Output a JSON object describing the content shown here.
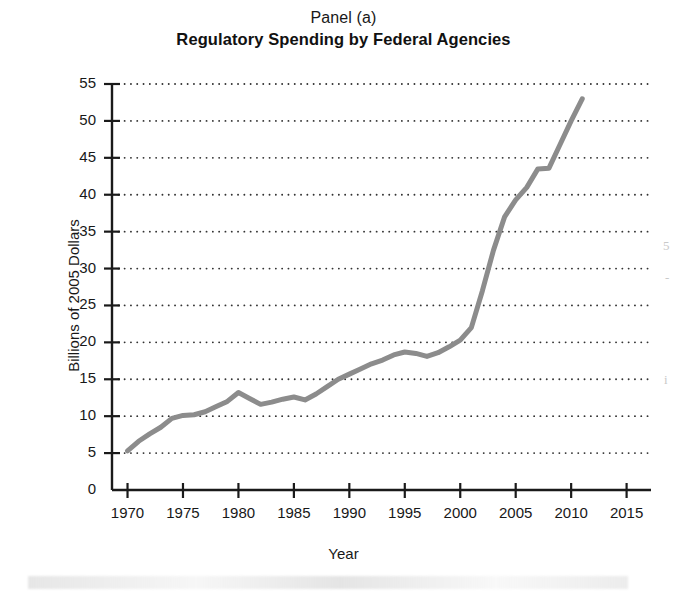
{
  "figure": {
    "panel_label": "Panel (a)",
    "title": "Regulatory Spending by Federal Agencies",
    "xlabel": "Year",
    "ylabel": "Billions of 2005 Dollars",
    "line_color": "#8c8c8c",
    "axis_color": "#1a1a1a",
    "grid_color": "#333333"
  },
  "edge_artifacts": {
    "right_top": "5",
    "right_mid": "-",
    "right_low": "i"
  },
  "chart_data": {
    "type": "line",
    "title": "Regulatory Spending by Federal Agencies",
    "subtitle": "Panel (a)",
    "xlabel": "Year",
    "ylabel": "Billions of 2005 Dollars",
    "xlim": [
      1968.6,
      1.0
    ],
    "x_axis_min": 1968.6,
    "x_axis_max": 2017.2,
    "ylim": [
      0,
      55
    ],
    "y_axis_min": 0,
    "y_axis_max": 55,
    "xticks": [
      1970,
      1975,
      1980,
      1985,
      1990,
      1995,
      2000,
      2005,
      2010,
      2015
    ],
    "yticks": [
      0,
      5,
      10,
      15,
      20,
      25,
      30,
      35,
      40,
      45,
      50,
      55
    ],
    "grid": "horizontal-dotted",
    "legend": "none",
    "series": [
      {
        "name": "Regulatory spending",
        "x": [
          1970,
          1971,
          1972,
          1973,
          1974,
          1975,
          1976,
          1977,
          1978,
          1979,
          1980,
          1981,
          1982,
          1983,
          1984,
          1985,
          1986,
          1987,
          1988,
          1989,
          1990,
          1991,
          1992,
          1993,
          1994,
          1995,
          1996,
          1997,
          1998,
          1999,
          2000,
          2001,
          2002,
          2003,
          2004,
          2005,
          2006,
          2007,
          2008,
          2009,
          2010,
          2011
        ],
        "values": [
          5.3,
          6.6,
          7.6,
          8.5,
          9.7,
          10.1,
          10.2,
          10.6,
          11.3,
          12.0,
          13.2,
          12.4,
          11.6,
          11.9,
          12.3,
          12.6,
          12.2,
          13.0,
          14.0,
          15.0,
          15.7,
          16.4,
          17.1,
          17.6,
          18.3,
          18.7,
          18.5,
          18.1,
          18.6,
          19.4,
          20.3,
          22.0,
          27.0,
          32.5,
          37.0,
          39.3,
          41.0,
          43.5,
          43.6,
          46.8,
          50.0,
          53.0
        ]
      }
    ]
  }
}
